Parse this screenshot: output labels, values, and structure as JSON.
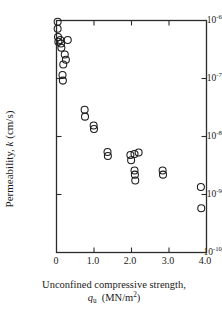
{
  "chart_data": {
    "type": "scatter",
    "title": "",
    "xlabel": "Unconfined compressive strength, q_u (MN/m^2)",
    "ylabel": "Permeability, k (cm/s)",
    "xlabel_line1": "Unconfined compressive strength,",
    "xlabel_line2_symbol": "q",
    "xlabel_line2_sub": "u",
    "xlabel_line2_units": "(MN/m",
    "xlabel_line2_units_sup": "2",
    "xlabel_line2_units_end": ")",
    "ylabel_prefix": "Permeability, ",
    "ylabel_symbol": "k",
    "ylabel_units": " (cm/s)",
    "xscale": "linear",
    "yscale": "log",
    "xlim": [
      0.0,
      4.0
    ],
    "ylim": [
      1e-10,
      1e-06
    ],
    "grid": false,
    "legend": false,
    "marker": "open-circle",
    "marker_color": "#1a1a1a",
    "marker_fill": "none",
    "xticks": [
      0,
      1.0,
      2.0,
      3.0,
      4.0
    ],
    "xtick_labels": [
      "0",
      "1.0",
      "2.0",
      "3.0",
      "4.0"
    ],
    "yticks": [
      1e-06,
      1e-07,
      1e-08,
      1e-09,
      1e-10
    ],
    "ytick_labels": [
      "10-6",
      "10-7",
      "10-8",
      "10-9",
      "10-10"
    ],
    "ytick_mantissa": "10",
    "ytick_exponents": [
      "-6",
      "-7",
      "-8",
      "-9",
      "-10"
    ],
    "points": [
      {
        "x": 0.03,
        "y": 9.5e-07
      },
      {
        "x": 0.03,
        "y": 7.2e-07
      },
      {
        "x": 0.04,
        "y": 5.2e-07
      },
      {
        "x": 0.05,
        "y": 4.3e-07
      },
      {
        "x": 0.1,
        "y": 4.6e-07
      },
      {
        "x": 0.12,
        "y": 4e-07
      },
      {
        "x": 0.13,
        "y": 3.4e-07
      },
      {
        "x": 0.3,
        "y": 4.6e-07
      },
      {
        "x": 0.22,
        "y": 2.6e-07
      },
      {
        "x": 0.25,
        "y": 2.1e-07
      },
      {
        "x": 0.18,
        "y": 1.75e-07
      },
      {
        "x": 0.16,
        "y": 1.15e-07
      },
      {
        "x": 0.17,
        "y": 9.2e-08
      },
      {
        "x": 0.75,
        "y": 2.9e-08
      },
      {
        "x": 0.76,
        "y": 2.2e-08
      },
      {
        "x": 0.99,
        "y": 1.55e-08
      },
      {
        "x": 1.0,
        "y": 1.35e-08
      },
      {
        "x": 1.36,
        "y": 5.4e-09
      },
      {
        "x": 1.37,
        "y": 4.6e-09
      },
      {
        "x": 1.97,
        "y": 4.8e-09
      },
      {
        "x": 2.08,
        "y": 5e-09
      },
      {
        "x": 1.99,
        "y": 3.9e-09
      },
      {
        "x": 2.19,
        "y": 5.3e-09
      },
      {
        "x": 2.08,
        "y": 2.6e-09
      },
      {
        "x": 2.09,
        "y": 2.2e-09
      },
      {
        "x": 2.1,
        "y": 1.75e-09
      },
      {
        "x": 2.83,
        "y": 2.6e-09
      },
      {
        "x": 2.84,
        "y": 2.2e-09
      },
      {
        "x": 3.85,
        "y": 1.35e-09
      },
      {
        "x": 3.86,
        "y": 5.8e-10
      }
    ]
  },
  "axes": {
    "frame_color": "#2b2b2b",
    "background": "#ffffff"
  }
}
